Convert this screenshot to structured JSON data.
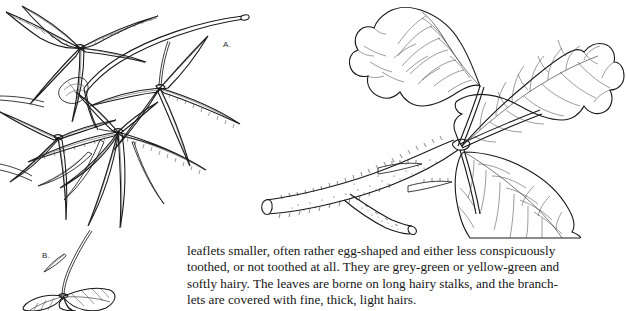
{
  "page": {
    "background_color": "#ffffff",
    "ink_color": "#1a1a1a",
    "width": 626,
    "height": 311
  },
  "figures": [
    {
      "id": "figure-a",
      "label": "A.",
      "description": "Palmately compound leaf with narrow lanceolate sharply toothed leaflets on a long slender stalk",
      "leaflet_shape": "narrow lanceolate",
      "margin": "sharply toothed",
      "position": "left"
    },
    {
      "id": "figure-b",
      "label": "B.",
      "description": "Small inset sketch of a compound leaf with broader untoothed leaflets on a slender stalk",
      "leaflet_shape": "egg-shaped",
      "margin": "not toothed",
      "position": "bottom-left"
    },
    {
      "id": "figure-right",
      "label": "",
      "description": "Trifoliate leaf with three broad egg-shaped leaflets with pinnate venation, borne on a hairy branchlet",
      "leaflet_shape": "broad egg-shaped",
      "margin": "entire, wavy",
      "leaflet_count": 3,
      "position": "right"
    }
  ],
  "body_text": {
    "lines": [
      "leaflets smaller, often rather egg-shaped and either less conspicuously",
      "toothed, or not toothed at all. They are grey-green or yellow-green and",
      "softly hairy. The leaves are borne on long hairy stalks, and the branch-",
      "lets are covered with fine, thick, light hairs."
    ],
    "full": "leaflets smaller, often rather egg-shaped and either less conspicuously\ntoothed, or not toothed at all. They are grey-green or yellow-green and\nsoftly hairy. The leaves are borne on long hairy stalks, and the branch-\nlets are covered with fine, thick, light hairs."
  }
}
